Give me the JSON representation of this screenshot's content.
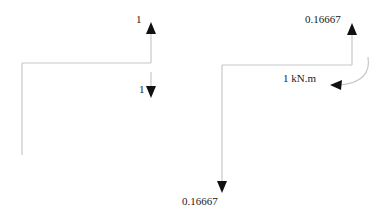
{
  "diagram": {
    "type": "free-body diagram",
    "colors": {
      "member": "#c8c8c8",
      "arrow": "#111111",
      "text": "#222222",
      "background": "#ffffff"
    },
    "left_frame": {
      "reaction_top_label": "1",
      "reaction_bottom_label": "1"
    },
    "right_frame": {
      "reaction_top_label": "0.16667",
      "reaction_bottom_label": "0.16667",
      "moment_label": "1 kN.m"
    }
  }
}
